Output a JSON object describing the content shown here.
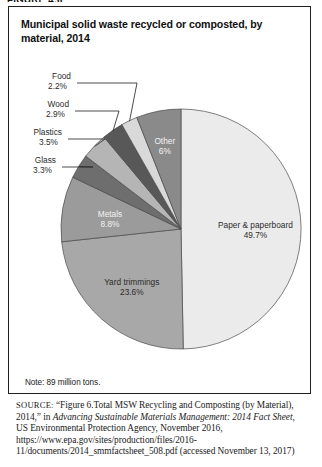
{
  "figure_label": "FIGURE 4.6",
  "chart_title": "Municipal solid waste recycled or composted, by material, 2014",
  "note": "Note: 89 million tons.",
  "source": {
    "label": "SOURCE:",
    "part1": " “Figure 6.Total MSW Recycling and Composting (by Material), 2014,” in ",
    "italic1": "Advancing Sustainable Materials Management: 2014 Fact Sheet",
    "part2": ", US Environmental Protection Agency, November 2016, https://www.epa.gov/sites/production/files/2016-11/documents/2014_smmfactsheet_508.pdf (accessed November 13, 2017)"
  },
  "chart_data": {
    "type": "pie",
    "title": "Municipal solid waste recycled or composted, by material, 2014",
    "unit": "percent",
    "total_note": "89 million tons",
    "legend_position": "none",
    "labels_on_slices": true,
    "categories": [
      "Paper & paperboard",
      "Yard trimmings",
      "Metals",
      "Glass",
      "Plastics",
      "Wood",
      "Food",
      "Other"
    ],
    "values": [
      49.7,
      23.6,
      8.8,
      3.3,
      3.5,
      2.9,
      2.2,
      6.0
    ],
    "value_labels": [
      "49.7%",
      "23.6%",
      "8.8%",
      "3.3%",
      "3.5%",
      "2.9%",
      "2.2%",
      "6%"
    ],
    "colors": [
      "#ebebeb",
      "#a8a8a8",
      "#9b9b9b",
      "#6e6e6e",
      "#b5b5b5",
      "#585858",
      "#d9d9d9",
      "#8a8a8a"
    ],
    "slices": [
      {
        "name": "Paper & paperboard",
        "value": 49.7,
        "label": "Paper & paperboard",
        "value_label": "49.7%",
        "color": "#ebebeb",
        "label_placement": "inside",
        "label_color": "dark"
      },
      {
        "name": "Yard trimmings",
        "value": 23.6,
        "label": "Yard trimmings",
        "value_label": "23.6%",
        "color": "#a8a8a8",
        "label_placement": "inside",
        "label_color": "dark"
      },
      {
        "name": "Metals",
        "value": 8.8,
        "label": "Metals",
        "value_label": "8.8%",
        "color": "#9b9b9b",
        "label_placement": "inside",
        "label_color": "light"
      },
      {
        "name": "Glass",
        "value": 3.3,
        "label": "Glass",
        "value_label": "3.3%",
        "color": "#6e6e6e",
        "label_placement": "leader",
        "label_color": "dark"
      },
      {
        "name": "Plastics",
        "value": 3.5,
        "label": "Plastics",
        "value_label": "3.5%",
        "color": "#b5b5b5",
        "label_placement": "leader",
        "label_color": "dark"
      },
      {
        "name": "Wood",
        "value": 2.9,
        "label": "Wood",
        "value_label": "2.9%",
        "color": "#585858",
        "label_placement": "leader",
        "label_color": "dark"
      },
      {
        "name": "Food",
        "value": 2.2,
        "label": "Food",
        "value_label": "2.2%",
        "color": "#d9d9d9",
        "label_placement": "leader",
        "label_color": "dark"
      },
      {
        "name": "Other",
        "value": 6.0,
        "label": "Other",
        "value_label": "6%",
        "color": "#8a8a8a",
        "label_placement": "inside",
        "label_color": "light"
      }
    ]
  }
}
